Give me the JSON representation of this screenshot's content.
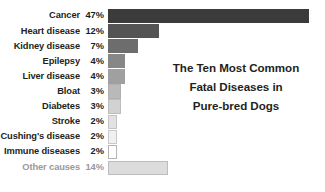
{
  "chart_data": {
    "type": "bar",
    "orientation": "horizontal",
    "title": "The Ten Most Common Fatal Diseases in Pure-bred Dogs",
    "title_lines": [
      "The Ten Most Common",
      "Fatal Diseases in",
      "Pure-bred Dogs"
    ],
    "xlabel": "",
    "ylabel": "",
    "xlim": [
      0,
      47
    ],
    "grid": false,
    "legend": "none",
    "value_unit": "%",
    "categories": [
      "Cancer",
      "Heart disease",
      "Kidney disease",
      "Epilepsy",
      "Liver disease",
      "Bloat",
      "Diabetes",
      "Stroke",
      "Cushing's disease",
      "Immune diseases",
      "Other causes"
    ],
    "values": [
      47,
      12,
      7,
      4,
      4,
      3,
      3,
      2,
      2,
      2,
      14
    ],
    "value_labels": [
      "47%",
      "12%",
      "7%",
      "4%",
      "4%",
      "3%",
      "3%",
      "2%",
      "2%",
      "2%",
      "14%"
    ],
    "bars": [
      {
        "label": "Cancer",
        "value": 47,
        "value_label": "47%",
        "fill": "#3b3b3b",
        "border": "#3b3b3b",
        "muted": false
      },
      {
        "label": "Heart disease",
        "value": 12,
        "value_label": "12%",
        "fill": "#545454",
        "border": "#545454",
        "muted": false
      },
      {
        "label": "Kidney disease",
        "value": 7,
        "value_label": "7%",
        "fill": "#6d6d6d",
        "border": "#6d6d6d",
        "muted": false
      },
      {
        "label": "Epilepsy",
        "value": 4,
        "value_label": "4%",
        "fill": "#878787",
        "border": "#878787",
        "muted": false
      },
      {
        "label": "Liver disease",
        "value": 4,
        "value_label": "4%",
        "fill": "#a0a0a0",
        "border": "#a0a0a0",
        "muted": false
      },
      {
        "label": "Bloat",
        "value": 3,
        "value_label": "3%",
        "fill": "#b9b9b9",
        "border": "#b0b0b0",
        "muted": false
      },
      {
        "label": "Diabetes",
        "value": 3,
        "value_label": "3%",
        "fill": "#d2d2d2",
        "border": "#bdbdbd",
        "muted": false
      },
      {
        "label": "Stroke",
        "value": 2,
        "value_label": "2%",
        "fill": "#e2e2e2",
        "border": "#c4c4c4",
        "muted": false
      },
      {
        "label": "Cushing's disease",
        "value": 2,
        "value_label": "2%",
        "fill": "#f0f0f0",
        "border": "#c9c9c9",
        "muted": false
      },
      {
        "label": "Immune diseases",
        "value": 2,
        "value_label": "2%",
        "fill": "#ffffff",
        "border": "#b5b5b5",
        "muted": false
      },
      {
        "label": "Other causes",
        "value": 14,
        "value_label": "14%",
        "fill": "#dcdcdc",
        "border": "#bdbdbd",
        "muted": true
      }
    ],
    "px_per_unit": 4.28,
    "bar_origin_x_px": 112,
    "colors": {
      "text": "#231f20",
      "muted_text": "#9a9a9a",
      "background": "#ffffff",
      "darkest_bar": "#3b3b3b",
      "lightest_bar": "#ffffff"
    }
  }
}
